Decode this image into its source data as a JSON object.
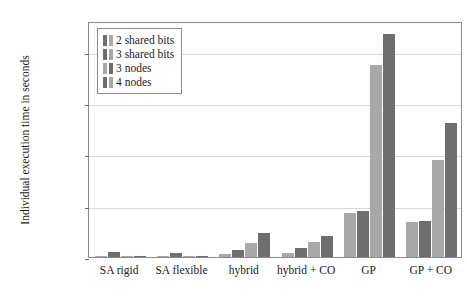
{
  "chart_data": {
    "type": "bar",
    "title": "",
    "xlabel": "",
    "ylabel": "Individual execution time in seconds",
    "categories": [
      "SA rigid",
      "SA flexible",
      "hybrid",
      "hybrid + CO",
      "GP",
      "GP + CO"
    ],
    "series": [
      {
        "name": "2 shared bits",
        "color": "#a8a8a8",
        "values": [
          280,
          200,
          600,
          700,
          8600,
          6900
        ]
      },
      {
        "name": "3 shared bits",
        "color": "#6e6e6e",
        "values": [
          900,
          800,
          1400,
          1800,
          9000,
          7000
        ]
      },
      {
        "name": "3 nodes",
        "color": "#a8a8a8",
        "values": [
          90,
          80,
          2700,
          3000,
          37500,
          19000
        ]
      },
      {
        "name": "4 nodes",
        "color": "#6e6e6e",
        "values": [
          120,
          110,
          4600,
          4100,
          43500,
          26200
        ]
      }
    ],
    "ylim": [
      0,
      46000
    ],
    "yticks": [
      0,
      10000,
      20000,
      30000,
      40000
    ],
    "ytick_labels": [
      "0",
      "10,000",
      "20,000",
      "30,000",
      "40,000"
    ],
    "grid": true,
    "legend_position": "top-left"
  },
  "legend": {
    "entries": [
      {
        "label": "2 shared bits"
      },
      {
        "label": "3 shared bits"
      },
      {
        "label": "3 nodes"
      },
      {
        "label": "4 nodes"
      }
    ]
  }
}
